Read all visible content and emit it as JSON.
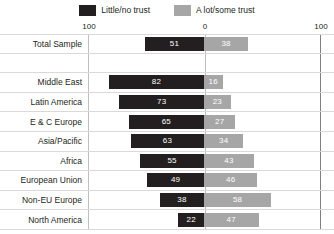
{
  "chart_data": {
    "type": "bar",
    "subtype": "diverging-horizontal-bar",
    "title": "",
    "xlabel": "",
    "ylabel": "",
    "grid": true,
    "legend_position": "top-center",
    "axis": {
      "ticks": [
        "100",
        "0",
        "100"
      ],
      "left_max": 100,
      "center": 0,
      "right_max": 100
    },
    "categories": [
      "Total Sample",
      "",
      "Middle East",
      "Latin America",
      "E & C Europe",
      "Asia/Pacific",
      "Africa",
      "European Union",
      "Non-EU Europe",
      "North America"
    ],
    "series": [
      {
        "name": "Little/no trust",
        "color": "#231f20",
        "direction": "left",
        "values": [
          51,
          null,
          82,
          73,
          65,
          63,
          55,
          49,
          38,
          22
        ]
      },
      {
        "name": "A lot/some trust",
        "color": "#a6a6a6",
        "direction": "right",
        "values": [
          38,
          null,
          16,
          23,
          27,
          34,
          43,
          46,
          58,
          47
        ]
      }
    ]
  },
  "legend": {
    "entries": [
      {
        "label": "Little/no trust",
        "color": "#231f20"
      },
      {
        "label": "A lot/some trust",
        "color": "#a6a6a6"
      }
    ]
  }
}
